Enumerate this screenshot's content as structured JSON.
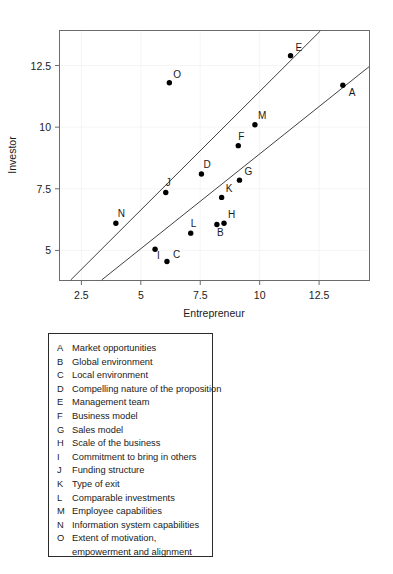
{
  "chart_data": {
    "type": "scatter",
    "title": "",
    "xlabel": "Entrepreneur",
    "ylabel": "Investor",
    "xlim": [
      1.6,
      14.6
    ],
    "ylim": [
      3.8,
      13.9
    ],
    "xticks": [
      2.5,
      5,
      7.5,
      10,
      12.5
    ],
    "xticklabels": [
      "2.5",
      "5",
      "7.5",
      "10",
      "12.5"
    ],
    "yticks": [
      5,
      7.5,
      10,
      12.5
    ],
    "yticklabels": [
      "5",
      "7.5",
      "10",
      "12.5"
    ],
    "grid": true,
    "legend_position": "below-plot-box",
    "points": [
      {
        "label": "A",
        "x": 13.5,
        "y": 11.7,
        "label_dx": 6,
        "label_dy": 11
      },
      {
        "label": "B",
        "x": 8.2,
        "y": 6.05,
        "label_dx": 0,
        "label_dy": 11
      },
      {
        "label": "C",
        "x": 6.1,
        "y": 4.55,
        "label_dx": 6,
        "label_dy": -4
      },
      {
        "label": "D",
        "x": 7.55,
        "y": 8.1,
        "label_dx": 2,
        "label_dy": -6
      },
      {
        "label": "E",
        "x": 11.3,
        "y": 12.9,
        "label_dx": 5,
        "label_dy": -5
      },
      {
        "label": "F",
        "x": 9.1,
        "y": 9.25,
        "label_dx": 0,
        "label_dy": -6
      },
      {
        "label": "G",
        "x": 9.15,
        "y": 7.85,
        "label_dx": 5,
        "label_dy": -5
      },
      {
        "label": "H",
        "x": 8.5,
        "y": 6.1,
        "label_dx": 4,
        "label_dy": -5
      },
      {
        "label": "I",
        "x": 5.6,
        "y": 5.05,
        "label_dx": 2,
        "label_dy": 10
      },
      {
        "label": "J",
        "x": 6.05,
        "y": 7.35,
        "label_dx": 0,
        "label_dy": -6
      },
      {
        "label": "K",
        "x": 8.4,
        "y": 7.15,
        "label_dx": 4,
        "label_dy": -5
      },
      {
        "label": "L",
        "x": 7.1,
        "y": 5.7,
        "label_dx": 0,
        "label_dy": -6
      },
      {
        "label": "M",
        "x": 9.8,
        "y": 10.1,
        "label_dx": 3,
        "label_dy": -6
      },
      {
        "label": "N",
        "x": 3.95,
        "y": 6.1,
        "label_dx": 2,
        "label_dy": -6
      },
      {
        "label": "O",
        "x": 6.2,
        "y": 11.8,
        "label_dx": 4,
        "label_dy": -5
      }
    ],
    "trend_lines": [
      {
        "name": "line-1",
        "x1": 2.05,
        "y1": 3.8,
        "x2": 12.55,
        "y2": 13.9
      },
      {
        "name": "line-2",
        "x1": 3.35,
        "y1": 3.8,
        "x2": 14.6,
        "y2": 12.45
      }
    ]
  },
  "legend": {
    "entries": [
      {
        "key": "A",
        "desc": "Market opportunities"
      },
      {
        "key": "B",
        "desc": "Global environment"
      },
      {
        "key": "C",
        "desc": "Local environment"
      },
      {
        "key": "D",
        "desc": "Compelling nature of the proposition"
      },
      {
        "key": "E",
        "desc": "Management team"
      },
      {
        "key": "F",
        "desc": "Business model"
      },
      {
        "key": "G",
        "desc": "Sales model"
      },
      {
        "key": "H",
        "desc": "Scale of the business"
      },
      {
        "key": "I",
        "desc": "Commitment to bring in others"
      },
      {
        "key": "J",
        "desc": "Funding structure"
      },
      {
        "key": "K",
        "desc": "Type of exit"
      },
      {
        "key": "L",
        "desc": "Comparable investments"
      },
      {
        "key": "M",
        "desc": "Employee capabilities"
      },
      {
        "key": "N",
        "desc": "Information system capabilities"
      },
      {
        "key": "O",
        "desc": "Extent of motivation,",
        "desc2": "empowerment and alignment"
      }
    ]
  }
}
